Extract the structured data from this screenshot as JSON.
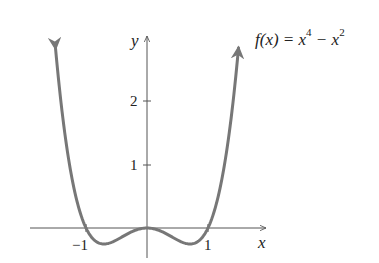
{
  "chart_data": {
    "type": "line",
    "function": "x^4 - x^2",
    "xlabel": "x",
    "ylabel": "y",
    "xlim": [
      -1.65,
      1.15
    ],
    "ylim": [
      -0.4,
      2.3
    ],
    "x_ticks": [
      -1,
      1
    ],
    "x_tick_labels": [
      "−1",
      "1"
    ],
    "y_ticks": [
      1,
      2
    ],
    "y_tick_labels": [
      "1",
      "2"
    ],
    "grid": false,
    "legend": null,
    "series": [
      {
        "name": "f(x) = x^4 - x^2",
        "color": "#777777",
        "x": [
          -1.5,
          -1.25,
          -1.0,
          -0.707,
          -0.5,
          0,
          0.5,
          0.707,
          1.0,
          1.25,
          1.5
        ],
        "values": [
          2.8125,
          0.8789,
          0,
          -0.25,
          -0.1875,
          0,
          -0.1875,
          -0.25,
          0,
          0.8789,
          2.8125
        ]
      }
    ],
    "annotations": [
      "arrowheads on both curve ends",
      "arrowheads on positive x and y axes"
    ]
  },
  "labels": {
    "function_prefix": "f(x) = x",
    "function_exp1": "4",
    "function_mid": " − x",
    "function_exp2": "2",
    "x_axis": "x",
    "y_axis": "y",
    "tick_neg1": "−1",
    "tick_pos1": "1",
    "tick_y1": "1",
    "tick_y2": "2"
  },
  "colors": {
    "curve": "#777777",
    "axes": "#555555",
    "text": "#222222"
  }
}
